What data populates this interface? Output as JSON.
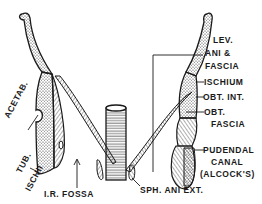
{
  "diagram": {
    "colors": {
      "ink": "#1a1a1a",
      "background": "#ffffff"
    },
    "labels": {
      "lev_ani_1": "LEV.",
      "lev_ani_2": "ANI &",
      "lev_ani_3": "FASCIA",
      "ischium": "ISCHIUM",
      "obt_int": "OBT. INT.",
      "obt_fascia_1": "OBT.",
      "obt_fascia_2": "FASCIA",
      "pudendal_1": "PUDENDAL",
      "pudendal_2": "CANAL",
      "pudendal_3": "(ALCOCK'S)",
      "acetab": "ACETAB.",
      "tub": "TUB.",
      "ischii": "ISCHII",
      "ir_fossa": "I.R. FOSSA",
      "sph_ani_ext": "SPH. ANI EXT."
    }
  }
}
